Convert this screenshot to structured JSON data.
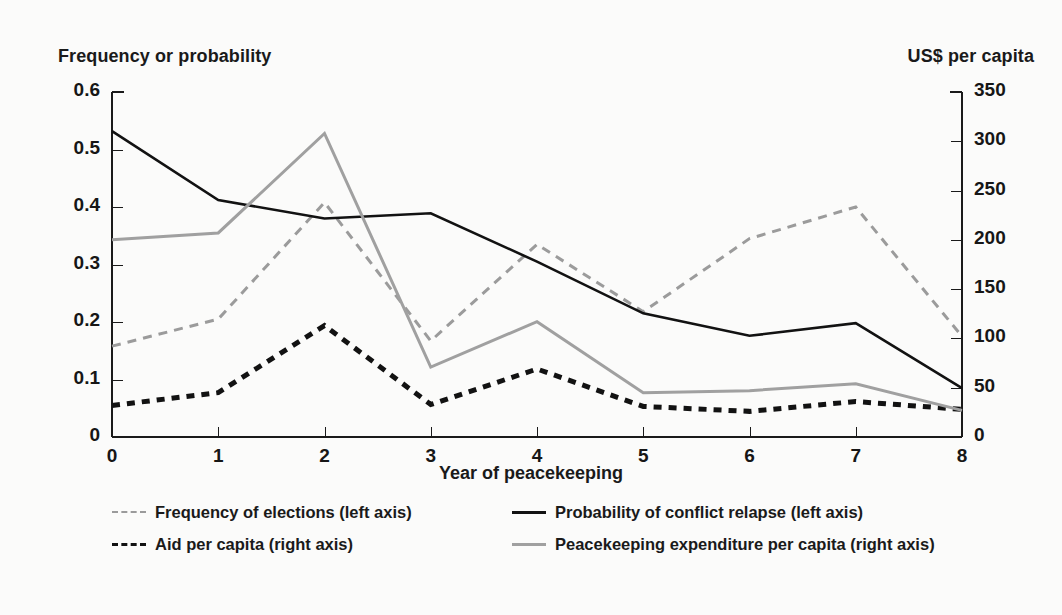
{
  "chart_data": {
    "type": "line",
    "title": "",
    "xlabel": "Year of peacekeeping",
    "ylabel": "Frequency or probability",
    "y2label": "US$ per capita",
    "x": [
      0,
      1,
      2,
      3,
      4,
      5,
      6,
      7,
      8
    ],
    "xlim": [
      0,
      8
    ],
    "ylim": [
      0,
      0.6
    ],
    "y2lim": [
      0,
      350
    ],
    "xticks": [
      "0",
      "1",
      "2",
      "3",
      "4",
      "5",
      "6",
      "7",
      "8"
    ],
    "yticks": [
      "0",
      "0.1",
      "0.2",
      "0.3",
      "0.4",
      "0.5",
      "0.6"
    ],
    "y2ticks": [
      "0",
      "50",
      "100",
      "150",
      "200",
      "250",
      "300",
      "350"
    ],
    "grid": false,
    "legend_position": "below",
    "series": [
      {
        "name": "Frequency of elections  (left axis)",
        "axis": "left",
        "style": "dashed",
        "color": "#9b9b9b",
        "width": 3,
        "values": [
          0.158,
          0.205,
          0.408,
          0.167,
          0.335,
          0.218,
          0.345,
          0.4,
          0.175
        ]
      },
      {
        "name": "Probability of conflict relapse  (left axis)",
        "axis": "left",
        "style": "solid",
        "color": "#121212",
        "width": 2.6,
        "values": [
          0.532,
          0.412,
          0.38,
          0.389,
          0.305,
          0.215,
          0.176,
          0.198,
          0.085
        ]
      },
      {
        "name": "Aid per capita  (right axis)",
        "axis": "right",
        "style": "dashed",
        "color": "#121212",
        "width": 5,
        "values": [
          32,
          45,
          113,
          33,
          69,
          31,
          26,
          36,
          28
        ]
      },
      {
        "name": "Peacekeeping expenditure per capita (right axis)",
        "axis": "right",
        "style": "solid",
        "color": "#a0a0a0",
        "width": 3,
        "values": [
          200,
          207,
          308,
          71,
          117,
          45,
          47,
          54,
          27
        ]
      }
    ]
  },
  "axes": {
    "left_title": "Frequency or probability",
    "right_title": "US$ per capita",
    "x_title": "Year of peacekeeping"
  },
  "legend": {
    "entries": [
      {
        "label": "Frequency of elections (left axis)",
        "swatch": "dashed-light-line-icon"
      },
      {
        "label": "Probability of conflict relapse  (left axis)",
        "swatch": "solid-dark-line-icon"
      },
      {
        "label": "Aid per capita  (right axis)",
        "swatch": "dashed-dark-line-icon"
      },
      {
        "label": "Peacekeeping expenditure per capita (right axis)",
        "swatch": "solid-gray-line-icon"
      }
    ]
  }
}
